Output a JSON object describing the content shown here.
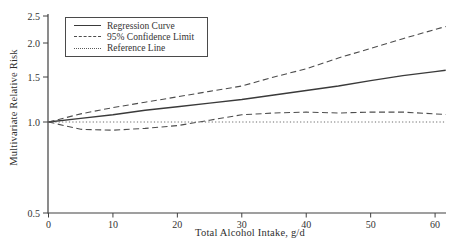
{
  "figure": {
    "x_axis_label": "Total Alcohol Intake, g/d",
    "y_axis_label": "Multivariate Relative Risk"
  },
  "legend": {
    "items": [
      {
        "label": "Regression Curve",
        "style": "solid"
      },
      {
        "label": "95% Confidence Limit",
        "style": "dashed"
      },
      {
        "label": "Reference Line",
        "style": "dotted"
      }
    ]
  },
  "colors": {
    "axis": "#404040",
    "solid_line": "#3a3a3a",
    "dashed_line": "#4d4d4d",
    "dotted_line": "#5a5a5a",
    "text": "#333333"
  },
  "chart_data": {
    "type": "line",
    "title": "",
    "xlabel": "Total Alcohol Intake, g/d",
    "ylabel": "Multivariate Relative Risk",
    "xlim": [
      0,
      60
    ],
    "ylim": [
      0.5,
      2.5
    ],
    "y_scale": "log",
    "grid": false,
    "legend_position": "top-left-inside",
    "x_tick_labels": [
      "0",
      "10",
      "20",
      "30",
      "40",
      "50",
      "60"
    ],
    "y_tick_labels": [
      "2.5",
      "2.0",
      "1.5",
      "1.0",
      "0.5"
    ],
    "x": [
      0,
      5,
      10,
      15,
      20,
      25,
      30,
      35,
      40,
      45,
      50,
      55,
      60
    ],
    "series": [
      {
        "name": "Regression Curve",
        "style": "solid",
        "values": [
          1.0,
          1.04,
          1.08,
          1.13,
          1.17,
          1.21,
          1.25,
          1.3,
          1.35,
          1.4,
          1.46,
          1.52,
          1.58
        ]
      },
      {
        "name": "95% Confidence Limit (upper)",
        "style": "dashed",
        "values": [
          1.0,
          1.09,
          1.16,
          1.22,
          1.28,
          1.34,
          1.4,
          1.5,
          1.62,
          1.78,
          1.92,
          2.08,
          2.25
        ]
      },
      {
        "name": "95% Confidence Limit (lower)",
        "style": "dashed",
        "values": [
          1.0,
          0.96,
          0.955,
          0.965,
          0.98,
          1.02,
          1.08,
          1.1,
          1.11,
          1.1,
          1.11,
          1.11,
          1.09
        ]
      },
      {
        "name": "Reference Line",
        "style": "dotted",
        "values": [
          1.0,
          1.0,
          1.0,
          1.0,
          1.0,
          1.0,
          1.0,
          1.0,
          1.0,
          1.0,
          1.0,
          1.0,
          1.0
        ]
      }
    ]
  }
}
